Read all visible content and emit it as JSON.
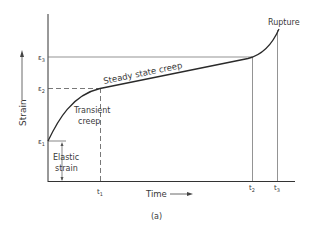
{
  "diagram": {
    "type": "creep-curve",
    "caption": "(a)",
    "axes": {
      "y_label": "Strain",
      "x_label": "Time"
    },
    "strain_levels": {
      "e1": "ε",
      "e1_sub": "1",
      "e2": "ε",
      "e2_sub": "2",
      "e3": "ε",
      "e3_sub": "3"
    },
    "time_marks": {
      "t1": "t",
      "t1_sub": "1",
      "t2": "t",
      "t2_sub": "2",
      "t3": "t",
      "t3_sub": "3"
    },
    "annotations": {
      "rupture": "Rupture",
      "steady_state": "Steady state creep",
      "transient_line1": "Transient",
      "transient_line2": "creep",
      "elastic_line1": "Elastic",
      "elastic_line2": "strain"
    },
    "colors": {
      "line": "#2a2a2a",
      "thin": "#555555"
    }
  }
}
